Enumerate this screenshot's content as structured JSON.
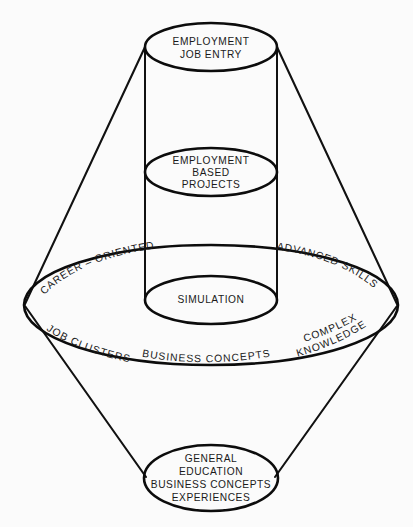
{
  "diagram": {
    "background_color": "#fbfbfb",
    "line_color": "#111111",
    "text_color": "#1a1a1a",
    "levels": [
      {
        "id": "top-ellipse",
        "name": "employment-job-entry",
        "lines": [
          "EMPLOYMENT",
          "JOB ENTRY"
        ]
      },
      {
        "id": "middle-ellipse",
        "name": "employment-based-projects",
        "lines": [
          "EMPLOYMENT",
          "BASED",
          "PROJECTS"
        ]
      },
      {
        "id": "simulation-ellipse",
        "name": "simulation",
        "lines": [
          "SIMULATION"
        ]
      },
      {
        "id": "bottom-ellipse",
        "name": "general-education",
        "lines": [
          "GENERAL",
          "EDUCATION",
          "BUSINESS CONCEPTS",
          "EXPERIENCES"
        ]
      }
    ],
    "band_labels": {
      "upper_left": "CAREER – ORIENTED",
      "upper_right": "ADVANCED SKILLS",
      "lower_left": "JOB CLUSTERS",
      "lower_center": "BUSINESS CONCEPTS",
      "lower_right_line1": "COMPLEX",
      "lower_right_line2": "KNOWLEDGE"
    },
    "ellipse_labels": {
      "top_line1": "EMPLOYMENT",
      "top_line2": "JOB ENTRY",
      "mid_line1": "EMPLOYMENT",
      "mid_line2": "BASED",
      "mid_line3": "PROJECTS",
      "sim_line1": "SIMULATION",
      "bottom_line1": "GENERAL",
      "bottom_line2": "EDUCATION",
      "bottom_line3": "BUSINESS CONCEPTS",
      "bottom_line4": "EXPERIENCES"
    }
  }
}
